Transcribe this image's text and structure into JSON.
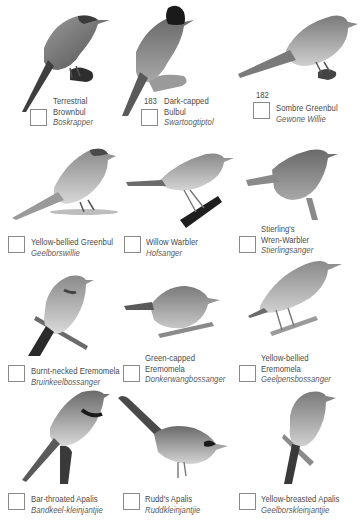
{
  "page": {
    "background": "#ffffff",
    "text_color": "#4a4a4a",
    "checkbox_border": "#8a8a8a"
  },
  "species": [
    {
      "number": "",
      "english_line1": "Terrestrial",
      "english_line2": "Brownbul",
      "afrikaans": "Boskrapper",
      "icon": "bird-brownbul-icon"
    },
    {
      "number": "183",
      "english_line1": "Dark-capped",
      "english_line2": "Bulbul",
      "afrikaans": "Swartoogtiptol",
      "icon": "bird-bulbul-icon"
    },
    {
      "number": "182",
      "english_line1": "Sombre Greenbul",
      "english_line2": "",
      "afrikaans": "Gewone Willie",
      "icon": "bird-greenbul-icon"
    },
    {
      "number": "",
      "english_line1": "Yellow-bellied Greenbul",
      "english_line2": "",
      "afrikaans": "Geelborswillie",
      "icon": "bird-greenbul-icon"
    },
    {
      "number": "",
      "english_line1": "Willow Warbler",
      "english_line2": "",
      "afrikaans": "Hofsanger",
      "icon": "bird-warbler-icon"
    },
    {
      "number": "",
      "english_line1": "Stierling's",
      "english_line2": "Wren-Warbler",
      "afrikaans": "Stierlingsanger",
      "icon": "bird-wren-warbler-icon"
    },
    {
      "number": "",
      "english_line1": "Burnt-necked Eremomela",
      "english_line2": "",
      "afrikaans": "Bruinkeelbossanger",
      "icon": "bird-eremomela-icon"
    },
    {
      "number": "",
      "english_line1": "Green-capped",
      "english_line2": "Eremomela",
      "afrikaans": "Donkerwangbossanger",
      "icon": "bird-eremomela-icon"
    },
    {
      "number": "",
      "english_line1": "Yellow-bellied",
      "english_line2": "Eremomela",
      "afrikaans": "Geelpensbossanger",
      "icon": "bird-eremomela-icon"
    },
    {
      "number": "",
      "english_line1": "Bar-throated Apalis",
      "english_line2": "",
      "afrikaans": "Bandkeel-kleinjantjie",
      "icon": "bird-apalis-icon"
    },
    {
      "number": "",
      "english_line1": "Rudd's Apalis",
      "english_line2": "",
      "afrikaans": "Ruddkleinjantjie",
      "icon": "bird-apalis-icon"
    },
    {
      "number": "",
      "english_line1": "Yellow-breasted Apalis",
      "english_line2": "",
      "afrikaans": "Geelborskleinjantjie",
      "icon": "bird-apalis-icon"
    }
  ]
}
